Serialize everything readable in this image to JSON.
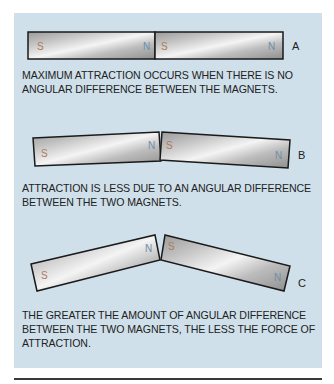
{
  "figure": {
    "background_color": "#cfe0ea",
    "pole_colors": {
      "S": "#b07a5a",
      "N": "#6f8fa8"
    },
    "panels": [
      {
        "id": "A",
        "label": "A",
        "magnets": [
          {
            "left_pole": "S",
            "right_pole": "N"
          },
          {
            "left_pole": "S",
            "right_pole": "N"
          }
        ],
        "caption_lines": [
          "MAXIMUM ATTRACTION OCCURS WHEN THERE IS NO",
          "ANGULAR DIFFERENCE BETWEEN THE MAGNETS."
        ]
      },
      {
        "id": "B",
        "label": "B",
        "magnets": [
          {
            "left_pole": "S",
            "right_pole": "N"
          },
          {
            "left_pole": "S",
            "right_pole": "N"
          }
        ],
        "caption_lines": [
          "ATTRACTION IS LESS DUE TO AN ANGULAR DIFFERENCE",
          "BETWEEN THE TWO MAGNETS."
        ]
      },
      {
        "id": "C",
        "label": "C",
        "magnets": [
          {
            "left_pole": "S",
            "right_pole": "N"
          },
          {
            "left_pole": "S",
            "right_pole": "N"
          }
        ],
        "caption_lines": [
          "THE GREATER THE AMOUNT OF ANGULAR DIFFERENCE",
          "BETWEEN THE TWO MAGNETS, THE LESS THE FORCE OF",
          "ATTRACTION."
        ]
      }
    ]
  }
}
